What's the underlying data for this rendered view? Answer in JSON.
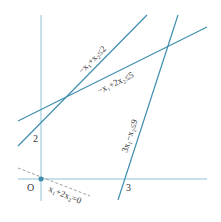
{
  "diagram": {
    "type": "linear-programming-feasible-region",
    "colors": {
      "axis": "#8fc3d6",
      "constraint": "#3f8fae",
      "dashed": "#a0a0a0",
      "origin_dot": "#3f8fae",
      "text": "#333333"
    },
    "axes": {
      "origin_label": "O",
      "y_tick_label": "2",
      "x_tick_label": "3"
    },
    "constraints": [
      {
        "id": "c1",
        "label": "−x₁+x₂≤2"
      },
      {
        "id": "c2",
        "label": "−x₁+2x₂≤5"
      },
      {
        "id": "c3",
        "label": "3x₁−x₂≤9"
      }
    ],
    "objective_line": {
      "label": "x₁+2x₂=0"
    }
  }
}
